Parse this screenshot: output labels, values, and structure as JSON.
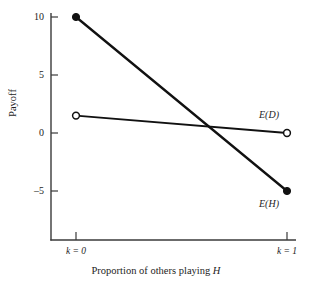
{
  "chart_data": {
    "type": "line",
    "title": "",
    "subtitle": "",
    "xlabel_prefix": "Proportion of others playing ",
    "xlabel_symbol": "H",
    "ylabel": "Payoff",
    "xlim": [
      0,
      1
    ],
    "ylim": [
      -6.5,
      10.8
    ],
    "grid": false,
    "legend_position": "inline-right",
    "x": [
      0,
      1
    ],
    "xtick_values": [
      0,
      1
    ],
    "xtick_labels": [
      "k = 0",
      "k = 1"
    ],
    "ytick_values": [
      10,
      5,
      0,
      -5
    ],
    "ytick_labels": [
      "10",
      "5",
      "0",
      "–5"
    ],
    "series": [
      {
        "name": "E(H)",
        "label": "E(H)",
        "values": [
          10,
          -5
        ],
        "marker": "filled-circle",
        "color": "#111111"
      },
      {
        "name": "E(D)",
        "label": "E(D)",
        "values": [
          1.5,
          0
        ],
        "marker": "open-circle",
        "color": "#111111"
      }
    ],
    "annotations": [
      {
        "text": "E(D)",
        "series": "E(D)",
        "x": 1,
        "y": 1.2
      },
      {
        "text": "E(H)",
        "series": "E(H)",
        "x": 1,
        "y": -6.2
      }
    ],
    "axis_color": "#3a3a3a",
    "background_color": "#ffffff"
  }
}
